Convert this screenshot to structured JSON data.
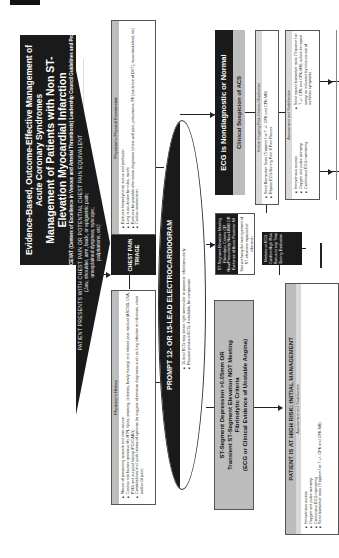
{
  "header": {
    "title_line1": "Evidence-Based, Outcome-Effective Management of Acute Coronary Syndromes",
    "title_line2": "Management of Patients with Non ST-Elevation Myocardial Infarction",
    "title_line3": "and High Risk Features",
    "subtitle": "CEVAT (Centers of Excellence in Venous and Arterial Thrombosis) Leadership Council Guidelines and Protocols"
  },
  "presentation": {
    "lead": "PATIENT PRESENTS WITH CHEST PAIN OR POTENTIAL CHEST PAIN EQUIVALENT",
    "detail_line1": "(Jaw, shoulder, arm, back, or epigastric pain;",
    "detail_line2": "unexplained dyspnea; syncope;",
    "detail_line3": "palpitations, etc)"
  },
  "triage": {
    "title": "CHEST PAIN TRIAGE",
    "history": {
      "heading": "Physician's History",
      "items": [
        "Nature of presenting episode and time course",
        "Cardiac risk factors (previous MI, HTN, lipids, smoking, diabetes, family history) and related past medical (ASCVD, CVA, PVD) and surgical history (PCI/CABG)",
        "Comorbidities and quick review of systems (to suggest alternative diagnoses such as lung infection or infarction, chest wall or GI pain)"
      ]
    },
    "exam": {
      "heading": "Physician's Physical Examination",
      "items": [
        "Evaluate hemodynamic status and perfusion",
        "Lung auscultation for rales, rocnhi",
        "Evaluate for possible alternative diagnoses (chest wall pain, pneumonia, PE [evidence of DVT], musculoskeletal, etc)",
        "Cardiac examination"
      ]
    }
  },
  "ecg": {
    "title": "PROMPT 12- OR 15-LEAD ELECTROCARDIOGRAM",
    "items": [
      "15-lead ECG may detect right ventricular or posterior infarctions early",
      "Request previous ECG, if available, for comparison"
    ]
  },
  "st_elevation": {
    "title": "ST-Segment Elevation Meeting Fibrinolytic Criteria OR New/Presumably New LBBB OR Evidence of Acute Posterior MI",
    "note": "See pathway for management of ST-elevation myocardial infarction"
  },
  "nondiagnostic": {
    "title": "ECG is Nondiagnostic or Normal",
    "subtitle": "Clinical Suspicion of ACS"
  },
  "evaluation": {
    "heading": "Initiate Ongoing Risk-Oriented Evaluation",
    "items": [
      "Send Biomarker Tests (Troponin I or T +/- CPK and CPK-MB)",
      "Repeat ECG During Pain If Pain Recurs"
    ]
  },
  "assessment_right": {
    "heading": "Assessment and Stabilization",
    "col1": [
      "Intravenous access",
      "Oxygen and pulse oximetry",
      "Continuous ECG monitoring"
    ],
    "col2": [
      "Send repeat biomarker tests (Troponin I or T +/- CPK and CPK-MB); schedule repeat assay as indicated by time course of ischemic symptoms"
    ]
  },
  "markers": {
    "text": "Markers or ECG Confirm High Risk Status at any Time During Evaluation"
  },
  "st_depression": {
    "line1": "ST-Segment Depression >0.05mm OR",
    "line2": "Transient ST-Segment Elevation NOT Meeting",
    "line3": "Fibrinolytic Criteria",
    "line4": "(ECG or Clinical Evidence of Unstable Angina)"
  },
  "high_risk": {
    "title": "PATIENT IS AT HIGH RISK:  INITIAL MANAGEMENT",
    "heading": "Assessment and Stabilization",
    "items": [
      "Intravenous access",
      "Oxygen and pulse oximetry",
      "Continuous ECG monitoring",
      "Send biomarker tests (Troponin I or T +/- CPK and CPK-MB)"
    ]
  },
  "colors": {
    "dark": "#1a1a1a",
    "gray": "#bcbcbc",
    "light_gray": "#d9d9d9"
  }
}
